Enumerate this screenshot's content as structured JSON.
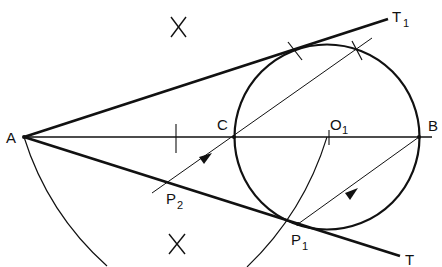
{
  "diagram": {
    "labels": {
      "A": "A",
      "B": "B",
      "C": "C",
      "O": "O",
      "O_sub": "1",
      "P1": "P",
      "P1_sub": "1",
      "P2": "P",
      "P2_sub": "2",
      "T": "T",
      "T1": "T",
      "T1_sub": "1"
    },
    "colors": {
      "stroke": "#111111",
      "background": "#ffffff"
    }
  }
}
